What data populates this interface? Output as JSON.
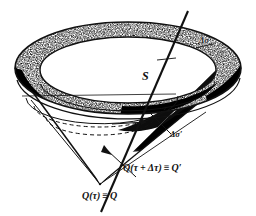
{
  "figure": {
    "domain": "diagram",
    "kind": "light-cone-retarded-time-diagram",
    "background_color": "#ffffff",
    "ink_color": "#111111",
    "labels": {
      "surface_S": "S",
      "delta_sigma": "Δσ",
      "delta_sigma_prime": "Δσ′",
      "q_prime": "Q(τ + Δτ) ≡ Q′",
      "q": "Q(τ) ≡ Q"
    },
    "elements": {
      "outer_rim_name": "outer-rim-band",
      "inner_rim_name": "inner-rim-band",
      "cone_name": "light-cone-surface",
      "world_line_name": "world-line",
      "dashed_ellipse_name": "dashed-inner-ellipse",
      "apex_name": "cone-apex"
    },
    "geometry": {
      "rim_outer_cx": 128,
      "rim_outer_cy": 68,
      "rim_outer_rx": 113,
      "rim_outer_ry": 46,
      "rim_inner_cx": 128,
      "rim_inner_cy": 70,
      "rim_inner_rx": 88,
      "rim_inner_ry": 33,
      "apex_x": 100,
      "apex_y": 184,
      "world_line_top_x": 188,
      "world_line_top_y": 11,
      "world_line_bottom_x": 101,
      "world_line_bottom_y": 212
    }
  }
}
